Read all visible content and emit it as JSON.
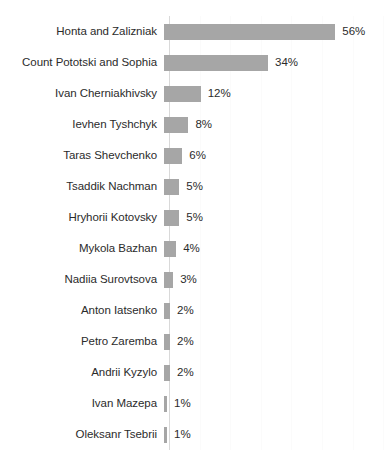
{
  "chart_data": {
    "type": "bar",
    "orientation": "horizontal",
    "title": "",
    "subtitle": "",
    "xlabel": "",
    "ylabel": "",
    "grid": true,
    "grid_axis": "x",
    "legend": false,
    "legend_position": "none",
    "value_labels": true,
    "value_label_format": "{v}%",
    "xlim": [
      0,
      70
    ],
    "x_tick_interval": 10,
    "x_tick_labels_visible": false,
    "categories": [
      "Honta and Zalizniak",
      "Count Pototski and Sophia",
      "Ivan Cherniakhivsky",
      "Ievhen Tyshchyk",
      "Taras Shevchenko",
      "Tsaddik Nachman",
      "Hryhorii Kotovsky",
      "Mykola Bazhan",
      "Nadiia Surovtsova",
      "Anton Iatsenko",
      "Petro Zaremba",
      "Andrii Kyzylo",
      "Ivan Mazepa",
      "Oleksanr Tsebrii"
    ],
    "values": [
      56,
      34,
      12,
      8,
      6,
      5,
      5,
      4,
      3,
      2,
      2,
      2,
      1,
      1
    ],
    "value_labels_text": [
      "56%",
      "34%",
      "12%",
      "8%",
      "6%",
      "5%",
      "5%",
      "4%",
      "3%",
      "2%",
      "2%",
      "2%",
      "1%",
      "1%"
    ],
    "series": [
      {
        "name": "",
        "color": "#a6a6a6",
        "values": [
          56,
          34,
          12,
          8,
          6,
          5,
          5,
          4,
          3,
          2,
          2,
          2,
          1,
          1
        ]
      }
    ]
  },
  "style": {
    "bar_color": "#a6a6a6",
    "text_color": "#2b2b2b",
    "axis_color": "#d9d9d9",
    "gridline_color": "#fbfbfb",
    "background": "#ffffff"
  }
}
